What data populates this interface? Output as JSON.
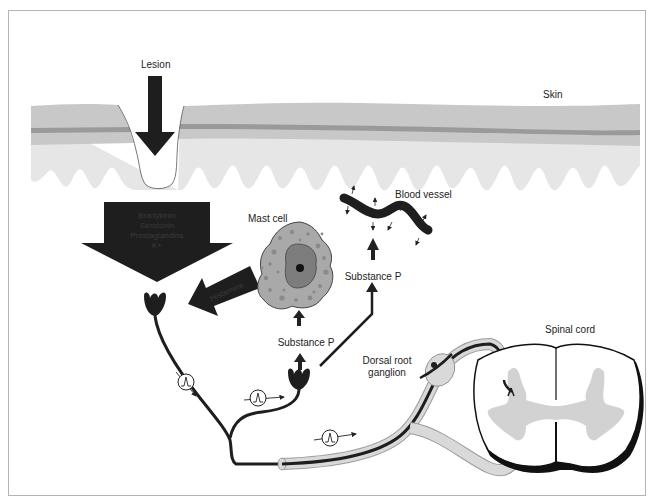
{
  "figure": {
    "labels": {
      "lesion": "Lesion",
      "skin": "Skin",
      "blood_vessel": "Blood vessel",
      "mast_cell": "Mast cell",
      "substance_p_upper": "Substance P",
      "substance_p_lower": "Substance P",
      "dorsal_root_ganglion_line1": "Dorsal root",
      "dorsal_root_ganglion_line2": "ganglion",
      "spinal_cord": "Spinal cord"
    },
    "mediators_arrow": {
      "lines": [
        "Bradykinin",
        "Serotonin",
        "Prostaglandins",
        "K+"
      ]
    },
    "histamine_arrow": {
      "label": "Histamine"
    },
    "action_potential_icons": [
      "action-potential-1",
      "action-potential-2",
      "action-potential-3"
    ],
    "colors": {
      "epidermis": "#c8c8c8",
      "basal_layer": "#9a9a9a",
      "dermis": "#e6e6e6",
      "arrow_dark": "#1e1e1e",
      "mast_cell_cytoplasm": "#a9a9a9",
      "mast_cell_nucleus": "#7d7d7d",
      "grey_matter": "#d2d2d2",
      "nerve_sheath": "#d9d9d9"
    }
  }
}
